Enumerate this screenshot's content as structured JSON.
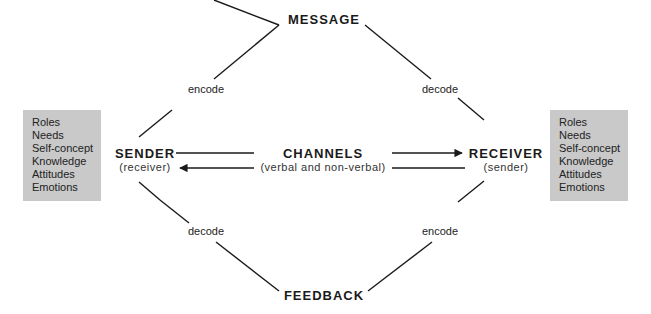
{
  "diagram": {
    "nodes": {
      "message": {
        "label": "MESSAGE"
      },
      "feedback": {
        "label": "FEEDBACK"
      },
      "sender": {
        "label": "SENDER",
        "sublabel": "(receiver)"
      },
      "receiver": {
        "label": "RECEIVER",
        "sublabel": "(sender)"
      },
      "channels": {
        "label": "CHANNELS",
        "sublabel": "(verbal and non-verbal)"
      }
    },
    "edge_labels": {
      "sender_to_message": "encode",
      "message_to_receiver": "decode",
      "receiver_to_feedback": "encode",
      "feedback_to_sender": "decode"
    },
    "left_box": {
      "items": [
        "Roles",
        "Needs",
        "Self-concept",
        "Knowledge",
        "Attitudes",
        "Emotions"
      ]
    },
    "right_box": {
      "items": [
        "Roles",
        "Needs",
        "Self-concept",
        "Knowledge",
        "Attitudes",
        "Emotions"
      ]
    },
    "colors": {
      "box_fill": "#c9c9c9",
      "line": "#1a1a1a",
      "background": "#ffffff"
    }
  }
}
